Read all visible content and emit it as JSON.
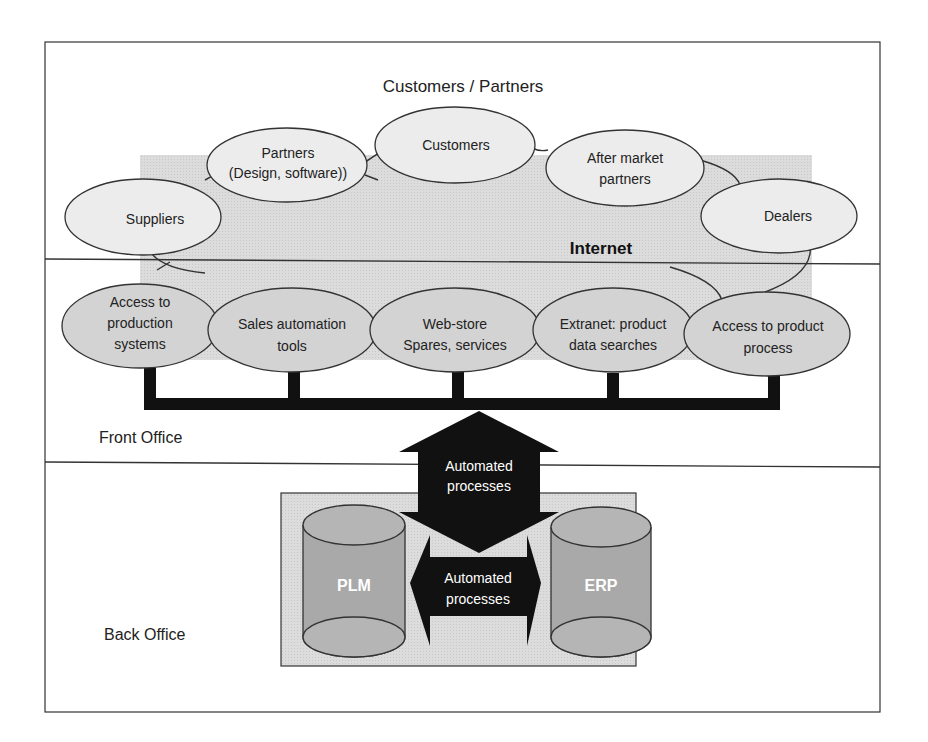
{
  "diagram": {
    "colors": {
      "background": "#ffffff",
      "border": "#333333",
      "internet_shade": "#d9d9d9",
      "ellipse_top": "#ebebeb",
      "ellipse_front": "#d0d0d0",
      "cylinder": "#a9a9a9",
      "back_box": "#e0e0e0",
      "arrow": "#111111",
      "text": "#222222",
      "arrow_text": "#ffffff"
    },
    "zones": {
      "top_label": "Customers / Partners",
      "front_label": "Front Office",
      "back_label": "Back Office"
    },
    "internet_label": "Internet",
    "top_nodes": [
      {
        "id": "suppliers",
        "lines": [
          "Suppliers"
        ]
      },
      {
        "id": "partners",
        "lines": [
          "Partners",
          "(Design, software))"
        ]
      },
      {
        "id": "customers",
        "lines": [
          "Customers"
        ]
      },
      {
        "id": "after-market",
        "lines": [
          "After market",
          "partners"
        ]
      },
      {
        "id": "dealers",
        "lines": [
          "Dealers"
        ]
      }
    ],
    "front_nodes": [
      {
        "id": "production",
        "lines": [
          "Access to",
          "production",
          "systems"
        ]
      },
      {
        "id": "sales",
        "lines": [
          "Sales automation",
          "tools"
        ]
      },
      {
        "id": "webstore",
        "lines": [
          "Web-store",
          "Spares, services"
        ]
      },
      {
        "id": "extranet",
        "lines": [
          "Extranet: product",
          "data searches"
        ]
      },
      {
        "id": "product-process",
        "lines": [
          "Access to product",
          "process"
        ]
      }
    ],
    "arrows": {
      "vertical": [
        "Automated",
        "processes"
      ],
      "horizontal": [
        "Automated",
        "processes"
      ]
    },
    "databases": {
      "left": "PLM",
      "right": "ERP"
    }
  }
}
